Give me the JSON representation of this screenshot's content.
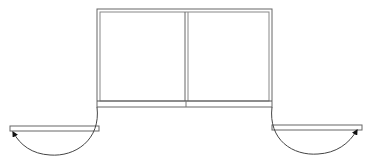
{
  "diagram": {
    "type": "floor-plan-door-swing",
    "colors": {
      "background": "#ffffff",
      "frame_stroke": "#555555",
      "arc_stroke": "#444444",
      "arrow_fill": "#111111"
    },
    "frame": {
      "x": 97,
      "y": 9,
      "width": 175,
      "height": 92,
      "divider_x": 186
    },
    "base_bar": {
      "y": 101,
      "height": 6
    },
    "doors": [
      {
        "side": "left",
        "panel": {
          "x": 10,
          "y": 126,
          "width": 89,
          "height": 5
        },
        "arc": "swing-open"
      },
      {
        "side": "right",
        "panel": {
          "x": 272,
          "y": 125,
          "width": 90,
          "height": 5
        },
        "arc": "swing-open"
      }
    ]
  }
}
